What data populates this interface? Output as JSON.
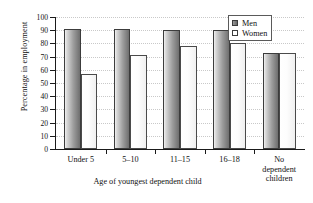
{
  "chart_data": {
    "type": "bar",
    "title": "",
    "xlabel": "Age of youngest dependent child",
    "ylabel": "Percentage in employment",
    "categories": [
      "Under 5",
      "5–10",
      "11–15",
      "16–18",
      "No dependent children"
    ],
    "series": [
      {
        "name": "Men",
        "values": [
          91,
          91,
          90,
          90,
          73
        ]
      },
      {
        "name": "Women",
        "values": [
          57,
          71,
          78,
          80,
          73
        ]
      }
    ],
    "ylim": [
      0,
      100
    ],
    "yticks": [
      0,
      10,
      20,
      30,
      40,
      50,
      60,
      70,
      80,
      90,
      100
    ],
    "ytick_labels": [
      "0",
      "10",
      "20",
      "30",
      "40",
      "50",
      "60",
      "70",
      "80",
      "90",
      "100"
    ],
    "grid": "horizontal-dotted",
    "legend_position": "top-right",
    "colors": {
      "men": "#7d7d7d",
      "women": "#ffffff",
      "axis": "#1a1a1a",
      "grid": "#c9c9c9"
    }
  },
  "legend": {
    "entries": [
      {
        "label": "Men"
      },
      {
        "label": "Women"
      }
    ]
  },
  "category_label_lines": [
    [
      "Under 5"
    ],
    [
      "5–10"
    ],
    [
      "11–15"
    ],
    [
      "16–18"
    ],
    [
      "No",
      "dependent",
      "children"
    ]
  ]
}
